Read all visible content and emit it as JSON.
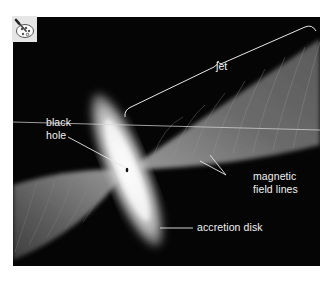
{
  "figure": {
    "background_color": "#050505",
    "icon": "palette-brush-icon",
    "labels": {
      "jet": "jet",
      "black_hole_line1": "black",
      "black_hole_line2": "hole",
      "magnetic_line1": "magnetic",
      "magnetic_line2": "field lines",
      "accretion_disk": "accretion disk"
    },
    "colors": {
      "disk": "#e8e8e8",
      "jet": "#6e6e6e",
      "label_text": "#f2f2f2",
      "icon_bg": "#e6e6e6"
    }
  }
}
